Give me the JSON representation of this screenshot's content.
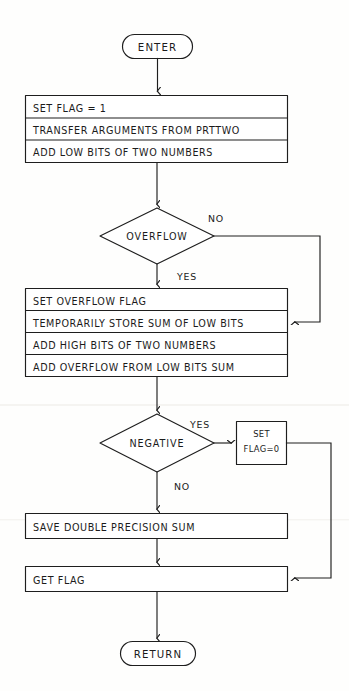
{
  "diagram": {
    "style": "hand-drawn flowchart, black ink on white paper",
    "ink_color": "#1e1e1e",
    "paper_color": "#fefefd"
  },
  "nodes": {
    "enter": {
      "label": "ENTER",
      "type": "terminator"
    },
    "init_block": {
      "type": "process-stack",
      "lines": [
        "SET FLAG = 1",
        "TRANSFER  ARGUMENTS FROM PRTTWO",
        "ADD LOW BITS OF TWO NUMBERS"
      ]
    },
    "overflow_decision": {
      "type": "decision",
      "label": "OVERFLOW",
      "branch_yes": "YES",
      "branch_no": "NO"
    },
    "overflow_block": {
      "type": "process-stack",
      "lines": [
        "SET OVERFLOW FLAG",
        "TEMPORARILY STORE SUM OF LOW BITS",
        "ADD HIGH BITS OF TWO NUMBERS",
        "ADD OVERFLOW FROM LOW BITS SUM"
      ]
    },
    "negative_decision": {
      "type": "decision",
      "label": "NEGATIVE",
      "branch_yes": "YES",
      "branch_no": "NO"
    },
    "set_flag_zero": {
      "type": "process",
      "line1": "SET",
      "line2": "FLAG=0"
    },
    "save_sum": {
      "type": "process",
      "label": "SAVE DOUBLE PRECISION SUM"
    },
    "get_flag": {
      "type": "process",
      "label": "GET FLAG"
    },
    "return": {
      "label": "RETURN",
      "type": "terminator"
    }
  },
  "edges": [
    {
      "name": "enter-to-init",
      "from": "enter",
      "to": "init_block",
      "label": ""
    },
    {
      "name": "init-to-overflow",
      "from": "init_block",
      "to": "overflow_decision",
      "label": ""
    },
    {
      "name": "overflow-yes",
      "from": "overflow_decision",
      "to": "overflow_block",
      "label": "YES"
    },
    {
      "name": "overflow-no",
      "from": "overflow_decision",
      "to": "overflow_block",
      "label": "NO"
    },
    {
      "name": "overflow-to-negative",
      "from": "overflow_block",
      "to": "negative_decision",
      "label": ""
    },
    {
      "name": "negative-yes",
      "from": "negative_decision",
      "to": "set_flag_zero",
      "label": "YES"
    },
    {
      "name": "negative-no",
      "from": "negative_decision",
      "to": "save_sum",
      "label": "NO"
    },
    {
      "name": "setflag-to-getflag",
      "from": "set_flag_zero",
      "to": "get_flag",
      "label": ""
    },
    {
      "name": "save-to-getflag",
      "from": "save_sum",
      "to": "get_flag",
      "label": ""
    },
    {
      "name": "getflag-to-return",
      "from": "get_flag",
      "to": "return",
      "label": ""
    }
  ]
}
